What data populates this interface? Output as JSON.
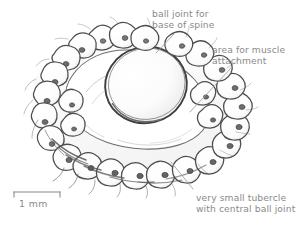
{
  "figure": {
    "kind": "scientific-line-drawing",
    "background_color": "#ffffff",
    "ink_color": "#4a4a4a",
    "shade_color": "#9a9a9a",
    "text_color": "#8a8a8a"
  },
  "annotations": [
    {
      "id": "ball-joint",
      "line1": "ball joint for",
      "line2": "base of spine",
      "leader_from": [
        174,
        34
      ],
      "leader_to": [
        156,
        53
      ]
    },
    {
      "id": "muscle",
      "line1": "area for muscle",
      "line2": "attachment",
      "leader_from": [
        232,
        67
      ],
      "leader_to": [
        190,
        112
      ]
    },
    {
      "id": "tubercle",
      "line1": "very small tubercle",
      "line2": "with central ball joint",
      "leader_from": [
        193,
        189
      ],
      "leader_to": [
        171,
        162
      ]
    }
  ],
  "scale_bar": {
    "label": "1 mm",
    "x_start": 14,
    "x_end": 60,
    "y": 192,
    "tick_height": 5
  },
  "drawing": {
    "central_ball": {
      "cx": 146,
      "cy": 85,
      "rx": 41,
      "ry": 38,
      "rotation": -14
    },
    "plate_outline": {
      "cx": 134,
      "cy": 100,
      "rx": 92,
      "ry": 74,
      "rotation": -12
    },
    "tubercle_count": 26,
    "tubercle_ring": {
      "cx": 132,
      "cy": 99,
      "rx": 86,
      "ry": 69
    }
  }
}
